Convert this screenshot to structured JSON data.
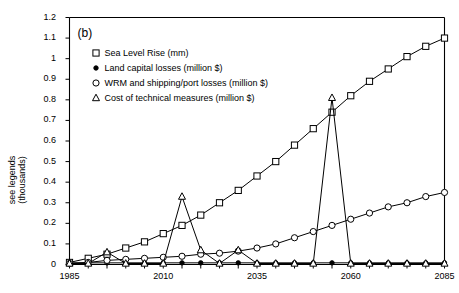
{
  "figure": {
    "panel_label": "(b)",
    "ylabel": "see legends\n(thousands)"
  },
  "chart_data": {
    "type": "line",
    "title": "",
    "panel": "(b)",
    "xlabel": "",
    "ylabel": "see legends (thousands)",
    "xlim": [
      1985,
      2085
    ],
    "ylim": [
      0,
      1.2
    ],
    "xticks": [
      1985,
      1990,
      1995,
      2000,
      2005,
      2010,
      2015,
      2020,
      2025,
      2030,
      2035,
      2040,
      2045,
      2050,
      2055,
      2060,
      2065,
      2070,
      2075,
      2080,
      2085
    ],
    "xtick_labels": [
      "1985",
      "",
      "",
      "",
      "",
      "2010",
      "",
      "",
      "",
      "",
      "2035",
      "",
      "",
      "",
      "",
      "2060",
      "",
      "",
      "",
      "",
      "2085"
    ],
    "xtick_labels_shown": [
      "1985",
      "2010",
      "2035",
      "2060",
      "2085"
    ],
    "yticks": [
      0,
      0.1,
      0.2,
      0.3,
      0.4,
      0.5,
      0.6,
      0.7,
      0.8,
      0.9,
      1.0,
      1.1,
      1.2
    ],
    "ytick_labels": [
      "0",
      "0.1",
      "0.2",
      "0.3",
      "0.4",
      "0.5",
      "0.6",
      "0.7",
      "0.8",
      "0.9",
      "1",
      "1.1",
      "1.2"
    ],
    "grid": false,
    "legend_position": "upper-left-inside",
    "x": [
      1985,
      1990,
      1995,
      2000,
      2005,
      2010,
      2015,
      2020,
      2025,
      2030,
      2035,
      2040,
      2045,
      2050,
      2055,
      2060,
      2065,
      2070,
      2075,
      2080,
      2085
    ],
    "series": [
      {
        "name": "Sea Level Rise (mm)",
        "marker": "square-open",
        "values": [
          0.01,
          0.03,
          0.05,
          0.08,
          0.11,
          0.15,
          0.19,
          0.24,
          0.3,
          0.36,
          0.43,
          0.5,
          0.58,
          0.66,
          0.74,
          0.82,
          0.89,
          0.95,
          1.01,
          1.06,
          1.1
        ]
      },
      {
        "name": "Land capital losses (million $)",
        "marker": "circle-filled",
        "values": [
          0.008,
          0.008,
          0.008,
          0.008,
          0.008,
          0.008,
          0.008,
          0.008,
          0.008,
          0.008,
          0.008,
          0.008,
          0.008,
          0.008,
          0.008,
          0.008,
          0.008,
          0.008,
          0.008,
          0.008,
          0.008
        ]
      },
      {
        "name": "WRM and shipping/port losses (million $)",
        "marker": "circle-open",
        "values": [
          0.005,
          0.01,
          0.02,
          0.025,
          0.03,
          0.035,
          0.04,
          0.05,
          0.055,
          0.065,
          0.08,
          0.1,
          0.13,
          0.16,
          0.19,
          0.22,
          0.25,
          0.28,
          0.3,
          0.33,
          0.35
        ]
      },
      {
        "name": "Cost of technical measures (million $)",
        "marker": "triangle-open",
        "values": [
          0.005,
          0.005,
          0.06,
          0.005,
          0.005,
          0.005,
          0.33,
          0.07,
          0.005,
          0.07,
          0.005,
          0.005,
          0.005,
          0.005,
          0.81,
          0.005,
          0.005,
          0.005,
          0.005,
          0.005,
          0.005
        ]
      }
    ],
    "legend": [
      "Sea Level Rise (mm)",
      "Land capital losses (million $)",
      "WRM and shipping/port losses (million $)",
      "Cost of technical measures (million $)"
    ]
  },
  "colors": {
    "line": "#000000",
    "axis": "#000000",
    "background": "#ffffff"
  }
}
